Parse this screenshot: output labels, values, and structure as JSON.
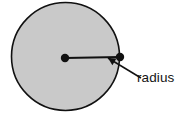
{
  "figure": {
    "type": "geometry-diagram",
    "canvas": {
      "width": 185,
      "height": 114,
      "background": "#ffffff"
    },
    "shape": {
      "name": "circle",
      "fill_color": "#c9c9c9",
      "stroke_color": "#111111",
      "stroke_width": 1.6,
      "center_x": 65.5,
      "center_y": 56.5,
      "radius": 54.0
    },
    "radius_segment": {
      "name": "radius-line",
      "color": "#111111",
      "width": 2.2,
      "start_x": 65,
      "start_y": 58,
      "end_x": 120,
      "end_y": 57
    },
    "points": [
      {
        "name": "center-point",
        "x": 65,
        "y": 58,
        "dot_radius": 4.2,
        "color": "#111111"
      },
      {
        "name": "edge-point",
        "x": 120,
        "y": 57,
        "dot_radius": 4.2,
        "color": "#111111"
      }
    ],
    "annotation": {
      "label": "radius",
      "label_x": 137,
      "label_y": 82,
      "label_color": "#141414",
      "font_size": 13.5,
      "leader_line": {
        "name": "leader-line",
        "color": "#111111",
        "width": 1.5,
        "from_x": 141,
        "from_y": 78,
        "to_x": 108,
        "to_y": 58,
        "arrowhead": "filled-triangle",
        "arrowhead_size": 7.5
      }
    }
  }
}
